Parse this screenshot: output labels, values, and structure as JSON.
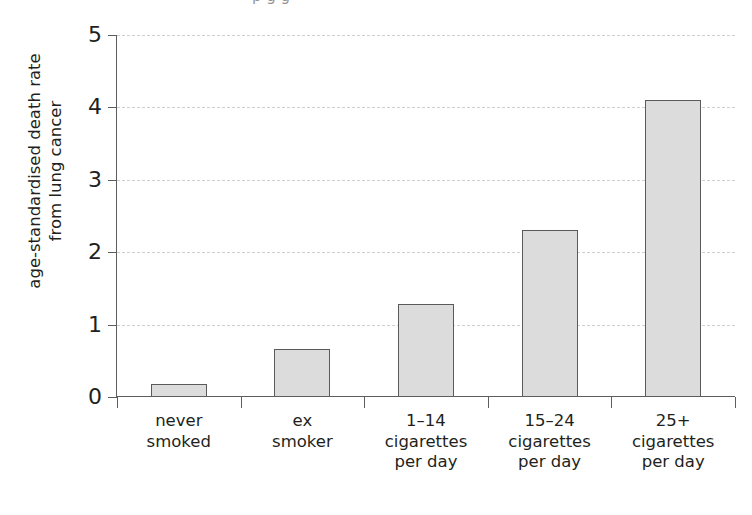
{
  "figure": {
    "title_cropped": "p            g        g",
    "y_axis_label_line1": "age-standardised death rate",
    "y_axis_label_line2": "from lung cancer"
  },
  "chart_data": {
    "type": "bar",
    "title": "",
    "xlabel": "",
    "ylabel": "age-standardised death rate from lung cancer",
    "ylim": [
      0,
      5
    ],
    "yticks": [
      0,
      1,
      2,
      3,
      4,
      5
    ],
    "ytick_labels": [
      "0",
      "1",
      "2",
      "3",
      "4",
      "5"
    ],
    "grid": true,
    "grid_axis": "y",
    "grid_style": "dashed",
    "legend": "none",
    "categories": [
      "never smoked",
      "ex smoker",
      "1–14 cigarettes per day",
      "15–24 cigarettes per day",
      "25+ cigarettes per day"
    ],
    "category_label_lines": [
      [
        "never",
        "smoked"
      ],
      [
        "ex",
        "smoker"
      ],
      [
        "1–14",
        "cigarettes",
        "per day"
      ],
      [
        "15–24",
        "cigarettes",
        "per day"
      ],
      [
        "25+",
        "cigarettes",
        "per day"
      ]
    ],
    "values": [
      0.18,
      0.66,
      1.28,
      2.3,
      4.1
    ],
    "bar_fill_color": "#dcdcdc",
    "bar_edge_color": "#5a5a5a",
    "axis_color": "#5d5d5d",
    "grid_color": "#cfcfcf",
    "text_color": "#231f20",
    "background_color": "#ffffff"
  }
}
